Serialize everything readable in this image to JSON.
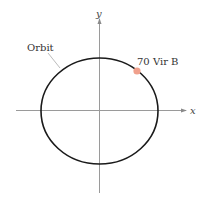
{
  "diagram": {
    "axes": {
      "x_label": "x",
      "y_label": "y",
      "color": "#9a9a9a"
    },
    "orbit": {
      "label": "Orbit",
      "shape": "ellipse",
      "color": "#1a1a1a"
    },
    "planet": {
      "label": "70 Vir B",
      "color": "#f0a08c"
    }
  }
}
